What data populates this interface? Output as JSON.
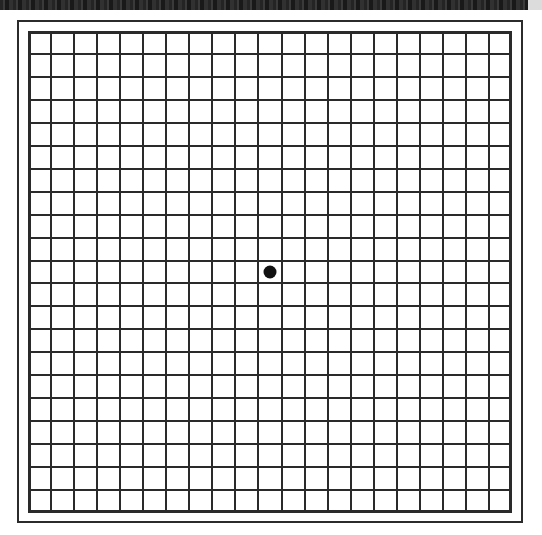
{
  "document": {
    "title": "Amsler Grid",
    "type": "vision-test-chart",
    "background_color": "#ffffff",
    "line_color": "#2a2a2a",
    "dot_color": "#111111",
    "frame_color": "#2b2b2b",
    "scan_band_color": "#232323"
  },
  "chart_data": {
    "type": "grid",
    "columns": 21,
    "rows": 21,
    "cell_size_px": 23,
    "grid_width_px": 484,
    "grid_height_px": 482,
    "fixation_dot": {
      "label": "central fixation dot",
      "column_index": 10,
      "row_index": 10,
      "x_px": 242,
      "y_px": 241,
      "diameter_px": 13
    },
    "outer_frame": {
      "x_px": 17,
      "y_px": 20,
      "width_px": 506,
      "height_px": 503
    },
    "grid_on": true,
    "legend": [],
    "annotations": []
  },
  "scan": {
    "band_label": "scanner-edge-band",
    "band_height_px": 10,
    "band_width_px": 528
  }
}
